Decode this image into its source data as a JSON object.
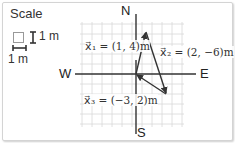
{
  "scale": {
    "title": "Scale",
    "vertical_label": "1 m",
    "horizontal_label": "1 m"
  },
  "compass": {
    "north": "N",
    "south": "S",
    "east": "E",
    "west": "W"
  },
  "vectors": [
    {
      "name": "x1",
      "label": "x⃗₁ = (1, 4)m",
      "components": [
        1,
        4
      ]
    },
    {
      "name": "x2",
      "label": "x⃗₂ = (2, −6)m",
      "components": [
        2,
        -6
      ]
    },
    {
      "name": "x3",
      "label": "x⃗₃ = (−3, 2)m",
      "components": [
        -3,
        2
      ]
    }
  ],
  "colors": {
    "grid": "#d8d8d8",
    "axis": "#333333",
    "vector": "#333333"
  }
}
